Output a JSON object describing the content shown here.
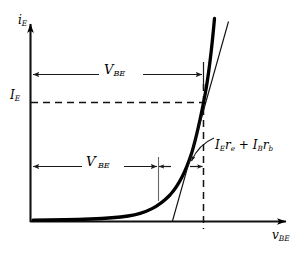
{
  "figure": {
    "type": "diagram",
    "axes": {
      "y_label": "i",
      "y_label_sub": "E",
      "x_label": "v",
      "x_label_sub": "BE",
      "origin_px": [
        30,
        222
      ],
      "x_axis_end_px": [
        292,
        222
      ],
      "y_axis_top_px": [
        30,
        18
      ]
    },
    "markers": {
      "operating_point_current_label": "I",
      "operating_point_current_sub": "E",
      "operating_point_y_px": 102,
      "operating_point_x_px": 203
    },
    "annotations": [
      {
        "id": "vbe-total",
        "label": "V",
        "sub": "BE",
        "prime": false,
        "arrow_y_px": 74,
        "arrow_x_start_px": 30,
        "arrow_x_end_px": 203,
        "double_headed": true
      },
      {
        "id": "vbe-prime",
        "label": "V",
        "sub": "BE",
        "prime": true,
        "prime_glyph": "′",
        "arrow_y_px": 166,
        "arrow_x_start_px": 30,
        "arrow_x_end_px": 158,
        "double_headed": true
      },
      {
        "id": "ohmic-drop",
        "label_parts": [
          "I",
          "E",
          "r",
          "e",
          "+",
          "I",
          "B",
          "r",
          "b"
        ],
        "label_text": "IE re + IB rb",
        "arrow_y_px": 166,
        "arrow_x_start_px": 158,
        "arrow_x_end_px": 203,
        "double_headed": true,
        "has_leader_line": true
      }
    ],
    "curves": [
      {
        "id": "exponential-characteristic",
        "style": "thick-solid",
        "stroke": "#000000",
        "stroke_width": 3.2,
        "note": "diode-like exponential i_E vs v_BE"
      },
      {
        "id": "tangent-line",
        "style": "thin-solid",
        "stroke": "#000000",
        "stroke_width": 1.1,
        "note": "tangent at operating point, extended to x-axis"
      }
    ],
    "guides": [
      {
        "id": "horizontal-dashed-IE",
        "style": "dashed",
        "from_px": [
          30,
          102
        ],
        "to_px": [
          210,
          102
        ]
      },
      {
        "id": "vertical-dashed-VBE",
        "style": "dashed",
        "from_px": [
          203,
          85
        ],
        "to_px": [
          203,
          228
        ]
      },
      {
        "id": "vertical-thin-VBEprime",
        "style": "solid-thin-gray",
        "from_px": [
          158,
          157
        ],
        "to_px": [
          158,
          201
        ]
      }
    ],
    "colors": {
      "ink": "#000000",
      "thin_ink": "#222222",
      "background": "#ffffff"
    }
  }
}
